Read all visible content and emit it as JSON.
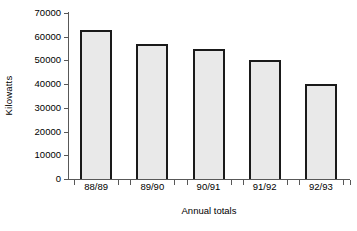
{
  "chart_data": {
    "type": "bar",
    "title": "",
    "subtitle": "",
    "xlabel": "Annual totals",
    "ylabel": "Kilowatts",
    "categories": [
      "88/89",
      "89/90",
      "90/91",
      "91/92",
      "92/93"
    ],
    "values": [
      63000,
      57000,
      55000,
      50000,
      40000
    ],
    "ylim": [
      0,
      70000
    ],
    "yticks": [
      0,
      10000,
      20000,
      30000,
      40000,
      50000,
      60000,
      70000
    ],
    "ytick_labels": [
      "0",
      "10000",
      "20000",
      "30000",
      "40000",
      "50000",
      "60000",
      "70000"
    ],
    "grid": false,
    "legend": false,
    "legend_position": "none",
    "series": [
      {
        "name": "Kilowatts",
        "values": [
          63000,
          57000,
          55000,
          50000,
          40000
        ]
      }
    ],
    "colors": {
      "bar_fill": "#e9e9e9",
      "bar_edge": "#1a1a1a",
      "axis": "#585858",
      "text": "#000000",
      "background": "#ffffff"
    }
  }
}
